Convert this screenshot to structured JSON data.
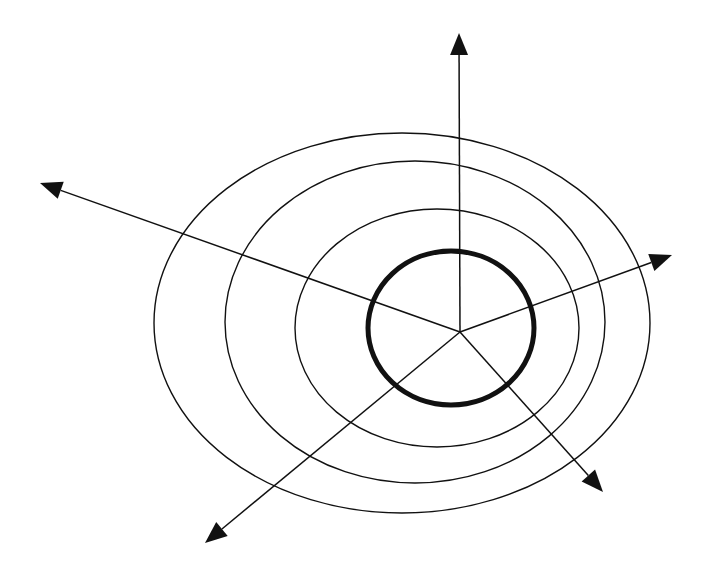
{
  "diagram": {
    "type": "radial-vector-diagram",
    "canvas": {
      "width": 705,
      "height": 574,
      "background": "#ffffff"
    },
    "stroke_color": "#111111",
    "center": {
      "x": 460,
      "y": 332
    },
    "rings": [
      {
        "name": "outer-ring",
        "cx": 402,
        "cy": 323,
        "rx": 248,
        "ry": 190,
        "weight": "thin"
      },
      {
        "name": "middle-ring",
        "cx": 415,
        "cy": 322,
        "rx": 190,
        "ry": 161,
        "weight": "thin"
      },
      {
        "name": "inner-ring",
        "cx": 437,
        "cy": 328,
        "rx": 142,
        "ry": 119,
        "weight": "thin"
      },
      {
        "name": "core-ring",
        "cx": 451,
        "cy": 328,
        "rx": 83,
        "ry": 77,
        "weight": "bold"
      }
    ],
    "arrows": [
      {
        "name": "arrow-up",
        "from": [
          460,
          332
        ],
        "to": [
          459,
          33
        ]
      },
      {
        "name": "arrow-upper-left",
        "from": [
          460,
          332
        ],
        "to": [
          40,
          183
        ]
      },
      {
        "name": "arrow-right",
        "from": [
          460,
          332
        ],
        "to": [
          672,
          255
        ]
      },
      {
        "name": "arrow-lower-right",
        "from": [
          460,
          332
        ],
        "to": [
          603,
          492
        ]
      },
      {
        "name": "arrow-lower-left",
        "from": [
          460,
          332
        ],
        "to": [
          205,
          543
        ]
      }
    ]
  }
}
